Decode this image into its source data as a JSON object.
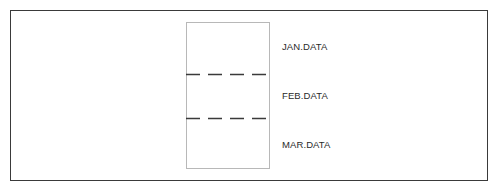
{
  "diagram": {
    "type": "file-segments",
    "container": {
      "kind": "single-file-box",
      "segments": [
        {
          "label": "JAN.DATA"
        },
        {
          "label": "FEB.DATA"
        },
        {
          "label": "MAR.DATA"
        }
      ],
      "separators": "dashed"
    }
  }
}
